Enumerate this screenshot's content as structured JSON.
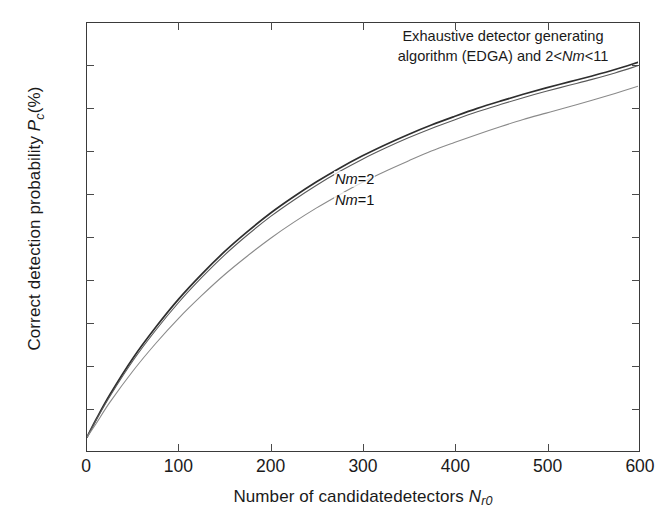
{
  "chart_data": {
    "type": "line",
    "title": "",
    "xlabel": "Number of candidatedetectors N_r0",
    "ylabel": "Correct detection probability P_c(%)",
    "xlim": [
      0,
      600
    ],
    "ylim": [
      0,
      100
    ],
    "xticks": [
      0,
      100,
      200,
      300,
      400,
      500,
      600
    ],
    "yticks": [
      0,
      10,
      20,
      30,
      40,
      50,
      60,
      70,
      80,
      90,
      100
    ],
    "grid": false,
    "legend": "inline-curve-labels",
    "annotations": [
      "Exhaustive detector generating algorithm (EDGA) and 2<Nm<11",
      "Nm=2",
      "Nm=1"
    ],
    "x": [
      0,
      10,
      25,
      50,
      75,
      100,
      125,
      150,
      175,
      200,
      225,
      250,
      275,
      300,
      325,
      350,
      375,
      400,
      425,
      450,
      475,
      500,
      525,
      550,
      575,
      600
    ],
    "series": [
      {
        "name": "EDGA and 2<Nm<11",
        "color": "#2e2e2e",
        "values": [
          3.0,
          7.2,
          13.0,
          21.5,
          28.8,
          35.4,
          41.2,
          46.5,
          51.2,
          55.5,
          59.3,
          62.8,
          66.0,
          68.9,
          71.5,
          73.9,
          76.1,
          78.1,
          80.0,
          81.7,
          83.3,
          84.8,
          86.2,
          87.6,
          89.1,
          90.8
        ]
      },
      {
        "name": "Nm=2",
        "color": "#5a5a5a",
        "values": [
          3.0,
          7.0,
          12.6,
          20.9,
          28.1,
          34.6,
          40.4,
          45.7,
          50.4,
          54.7,
          58.5,
          62.0,
          65.2,
          68.1,
          70.7,
          73.1,
          75.3,
          77.3,
          79.2,
          80.9,
          82.5,
          84.0,
          85.4,
          86.8,
          88.3,
          90.0
        ]
      },
      {
        "name": "Nm=1",
        "color": "#8a8a8a",
        "values": [
          3.0,
          6.2,
          11.2,
          18.5,
          25.0,
          30.9,
          36.2,
          41.1,
          45.5,
          49.6,
          53.3,
          56.7,
          59.8,
          62.7,
          65.3,
          67.7,
          70.0,
          72.0,
          73.9,
          75.7,
          77.4,
          78.9,
          80.4,
          81.9,
          83.5,
          85.2
        ]
      }
    ]
  },
  "axes": {
    "y_title_pre": "Correct detection probability ",
    "y_title_sym": "P",
    "y_title_sub": "c",
    "y_title_post": "(%)",
    "x_title_pre": "Number of candidatedetectors ",
    "x_title_sym": "N",
    "x_title_sub": "r0",
    "ytick_labels": [
      "100",
      "90",
      "80",
      "70",
      "60",
      "50",
      "40",
      "30",
      "20",
      "10",
      "0"
    ],
    "xtick_labels": [
      "0",
      "100",
      "200",
      "300",
      "400",
      "500",
      "600"
    ]
  },
  "annotation": {
    "line1": "Exhaustive detector generating",
    "line2_pre": "algorithm (EDGA) and 2<",
    "line2_sym": "Nm",
    "line2_post": "<11"
  },
  "curve_labels": {
    "nm2_sym": "Nm",
    "nm2_val": "=2",
    "nm1_sym": "Nm",
    "nm1_val": "=1"
  }
}
